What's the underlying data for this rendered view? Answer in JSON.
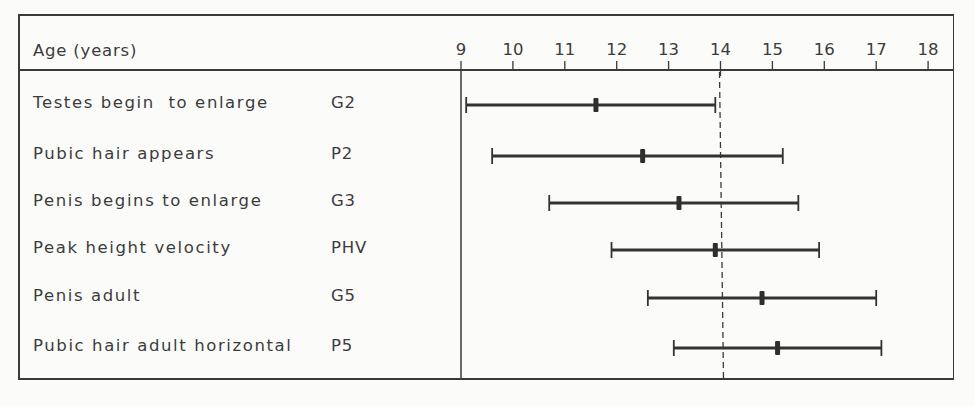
{
  "chart_data": {
    "type": "range-bar",
    "title": "",
    "xlabel": "Age (years)",
    "ylabel": "",
    "xlim": [
      9,
      18
    ],
    "x_ticks": [
      9,
      10,
      11,
      12,
      13,
      14,
      15,
      16,
      17,
      18
    ],
    "grid": false,
    "reference_line": {
      "x": 14.0,
      "style": "dashed"
    },
    "rows": [
      {
        "label": "Testes begin  to enlarge",
        "code": "G2",
        "start": 9.1,
        "median": 11.6,
        "end": 13.9
      },
      {
        "label": "Pubic hair appears",
        "code": "P2",
        "start": 9.6,
        "median": 12.5,
        "end": 15.2
      },
      {
        "label": "Penis begins to enlarge",
        "code": "G3",
        "start": 10.7,
        "median": 13.2,
        "end": 15.5
      },
      {
        "label": "Peak height velocity",
        "code": "PHV",
        "start": 11.9,
        "median": 13.9,
        "end": 15.9
      },
      {
        "label": "Penis adult",
        "code": "G5",
        "start": 12.6,
        "median": 14.8,
        "end": 17.0
      },
      {
        "label": "Pubic hair adult horizontal",
        "code": "P5",
        "start": 13.1,
        "median": 15.1,
        "end": 17.1
      }
    ]
  },
  "header": {
    "axis_title": "Age (years)"
  },
  "colors": {
    "ink": "#3a3a3a",
    "paper": "#fbfbfa"
  }
}
